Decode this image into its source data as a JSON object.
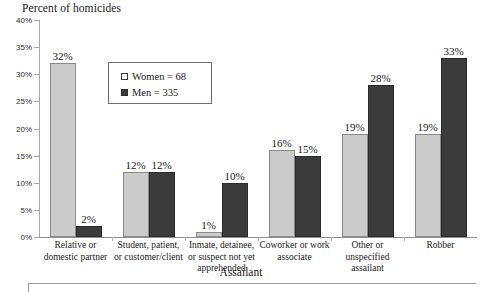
{
  "chart_data": {
    "type": "bar",
    "title": "",
    "ylabel": "Percent of homicides",
    "xlabel": "Assailant",
    "ylim": [
      0,
      40
    ],
    "ytick_labels": [
      "0%",
      "5%",
      "10%",
      "15%",
      "20%",
      "25%",
      "30%",
      "35%",
      "40%"
    ],
    "ytick_values": [
      0,
      5,
      10,
      15,
      20,
      25,
      30,
      35,
      40
    ],
    "grid": false,
    "legend_position": "upper-left-inside",
    "categories": [
      "Relative or domestic partner",
      "Student, patient, or customer/client",
      "Inmate, detainee, or suspect not yet apprehended",
      "Coworker or work associate",
      "Other or unspecified assailant",
      "Robber"
    ],
    "series": [
      {
        "name": "Women = 68",
        "short_name": "Women",
        "count": 68,
        "color": "#cbcbcb",
        "values": [
          32,
          12,
          1,
          16,
          19,
          19
        ],
        "value_labels": [
          "32%",
          "12%",
          "1%",
          "16%",
          "19%",
          "19%"
        ]
      },
      {
        "name": "Men = 335",
        "short_name": "Men",
        "count": 335,
        "color": "#3b3b3b",
        "values": [
          2,
          12,
          10,
          15,
          28,
          33
        ],
        "value_labels": [
          "2%",
          "12%",
          "10%",
          "15%",
          "28%",
          "33%"
        ]
      }
    ]
  },
  "legend": {
    "items": [
      {
        "label": "Women = 68",
        "swatch": "women"
      },
      {
        "label": "Men = 335",
        "swatch": "men"
      }
    ]
  },
  "category_lines": [
    [
      "Relative or",
      "domestic partner"
    ],
    [
      "Student, patient,",
      "or customer/client"
    ],
    [
      "Inmate, detainee,",
      "or suspect not yet",
      "apprehended"
    ],
    [
      "Coworker or work",
      "associate"
    ],
    [
      "Other or",
      "unspecified",
      "assailant"
    ],
    [
      "Robber"
    ]
  ]
}
